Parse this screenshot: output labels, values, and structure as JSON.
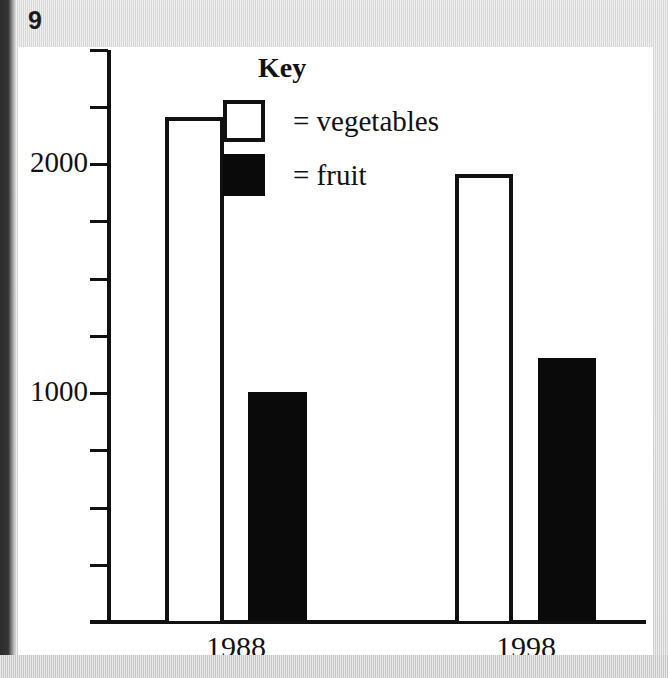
{
  "page": {
    "number": "9",
    "background_color": "#d8d8d8",
    "sheet_color": "#ffffff"
  },
  "legend": {
    "title": "Key",
    "items": [
      {
        "swatch": "white-square-outline",
        "label": "= vegetables",
        "color": "#ffffff"
      },
      {
        "swatch": "black-square-filled",
        "label": "= fruit",
        "color": "#0a0a0a"
      }
    ]
  },
  "chart_data": {
    "type": "bar",
    "title": "",
    "subtitle": "",
    "xlabel": "",
    "ylabel": "",
    "categories": [
      "1988",
      "1998"
    ],
    "series": [
      {
        "name": "vegetables",
        "values": [
          2200,
          1950
        ],
        "color": "#ffffff"
      },
      {
        "name": "fruit",
        "values": [
          1000,
          1150
        ],
        "color": "#0a0a0a"
      }
    ],
    "ylim": [
      0,
      2500
    ],
    "ytick_values": [
      0,
      250,
      500,
      750,
      1000,
      1250,
      1500,
      1750,
      2000,
      2250,
      2500
    ],
    "ytick_labels": [
      "",
      "",
      "",
      "",
      "1000",
      "",
      "",
      "",
      "2000",
      "",
      ""
    ],
    "labeled_ticks": [
      "1000",
      "2000"
    ],
    "grid": false,
    "legend_position": "top-center"
  },
  "axis": {
    "y_labels": [
      {
        "text": "2000",
        "value": 2000
      },
      {
        "text": "1000",
        "value": 1000
      }
    ],
    "x_labels": [
      "1988",
      "1998"
    ]
  }
}
